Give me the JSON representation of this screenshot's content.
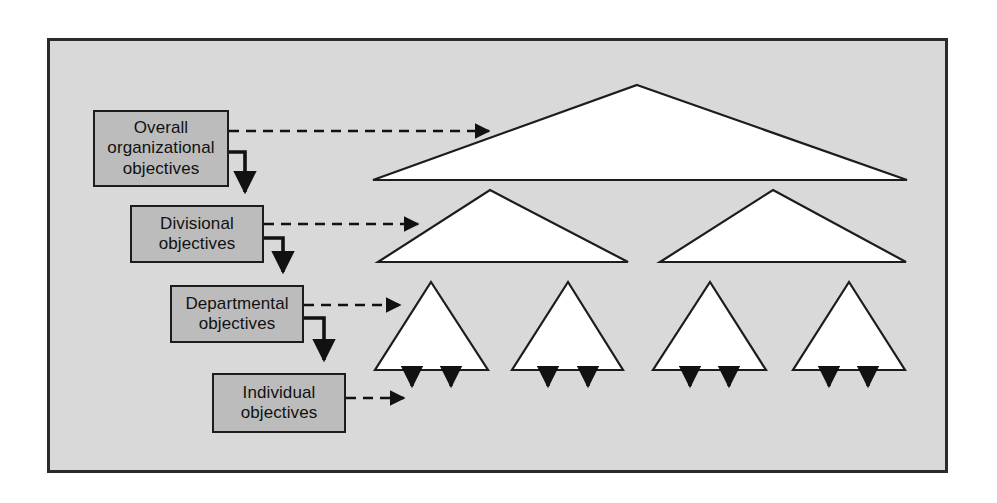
{
  "diagram": {
    "frame": {
      "background_color": "#d9d9d9",
      "border_color": "#2b2b2b"
    },
    "box_style": {
      "fill_color": "#bcbcbc",
      "border_color": "#1c1c1c",
      "text_color": "#111111"
    },
    "boxes": [
      {
        "id": "overall",
        "label": "Overall\norganizational\nobjectives",
        "line1": "Overall",
        "line2": "organizational",
        "line3": "objectives"
      },
      {
        "id": "divisional",
        "label": "Divisional\nobjectives",
        "line1": "Divisional",
        "line2": "objectives",
        "line3": ""
      },
      {
        "id": "departmental",
        "label": "Departmental\nobjectives",
        "line1": "Departmental",
        "line2": "objectives",
        "line3": ""
      },
      {
        "id": "individual",
        "label": "Individual\nobjectives",
        "line1": "Individual",
        "line2": "objectives",
        "line3": ""
      }
    ],
    "levels": [
      {
        "level": 1,
        "name": "organization",
        "shape": "triangle",
        "count": 1
      },
      {
        "level": 2,
        "name": "division",
        "shape": "triangle",
        "count": 2
      },
      {
        "level": 3,
        "name": "department",
        "shape": "triangle",
        "count": 4
      },
      {
        "level": 4,
        "name": "individual",
        "shape": "arrow",
        "count": 8
      }
    ],
    "connector_style": {
      "solid_color": "#111111",
      "dashed_color": "#111111"
    }
  }
}
